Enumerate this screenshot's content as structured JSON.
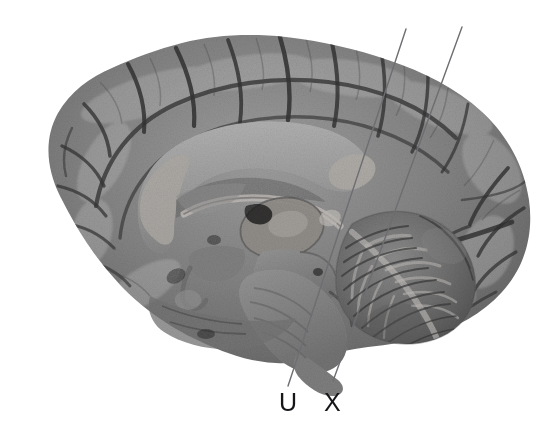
{
  "figure": {
    "kind": "anatomical-illustration",
    "background_color": "#ffffff",
    "width": 552,
    "height": 444
  },
  "labels": [
    {
      "id": "u",
      "text": "U",
      "x": 279,
      "y": 390,
      "color": "#16161a",
      "leader_line": {
        "x1": 288,
        "y1": 386,
        "x2": 406,
        "y2": 29,
        "color": "#6e6e72",
        "width": 1.4
      }
    },
    {
      "id": "x",
      "text": "X",
      "x": 324,
      "y": 390,
      "color": "#16161a",
      "leader_line": {
        "x1": 333,
        "y1": 381,
        "x2": 462,
        "y2": 27,
        "color": "#6e6e72",
        "width": 1.4
      }
    }
  ],
  "palette": {
    "tissue_mid": "#7b7b7b",
    "tissue_light": "#9d9d9d",
    "tissue_highlight": "#b4b4b4",
    "tissue_dark": "#5a5a5a",
    "sulcus": "#3c3c3c",
    "sulcus_deep": "#262626",
    "cerebellum": "#6f6f6f",
    "brainstem": "#848484",
    "corpus_callosum": "#a5a5a5",
    "leader_line": "#6e6e72",
    "label_text": "#16161a",
    "background": "#ffffff"
  }
}
